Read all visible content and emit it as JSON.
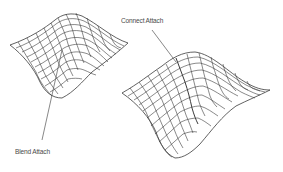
{
  "diagram": {
    "background": "#ffffff",
    "mesh_stroke": "#3a3a3a",
    "surface_fill": "#ececec",
    "surfaces": [
      {
        "id": "blend-surface",
        "description": "Left wavy NURBS surface patch with grid isoparms",
        "callout": {
          "label": "Blend Attach",
          "leader_from": [
            42,
            140
          ],
          "leader_to": [
            62,
            50
          ]
        }
      },
      {
        "id": "connect-surface",
        "description": "Right wavy NURBS surface patch with grid isoparms and a sharp seam",
        "callout": {
          "label": "Connect Attach",
          "leader_from": [
            152,
            30
          ],
          "leader_to": [
            176,
            62
          ]
        }
      }
    ]
  },
  "labels": {
    "blend": "Blend Attach",
    "connect": "Connect Attach"
  }
}
